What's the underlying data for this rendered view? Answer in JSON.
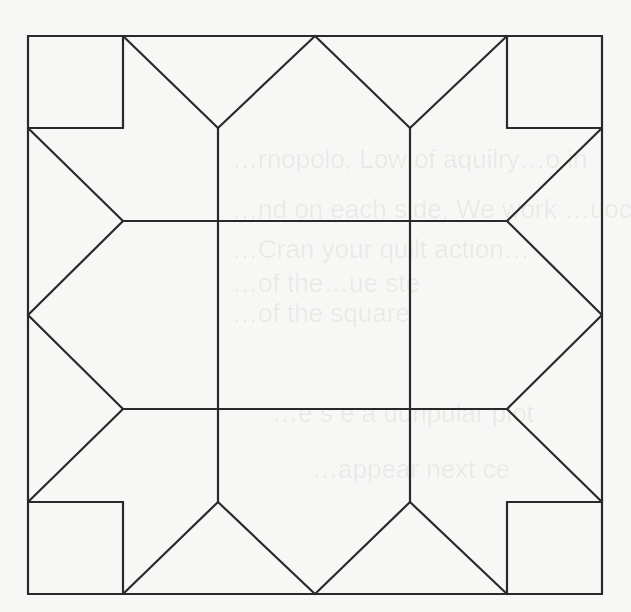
{
  "diagram": {
    "stroke_color": "#2a2a2a",
    "background_color": "#f7f7f5",
    "grid": {
      "xs": [
        28,
        123,
        218,
        315,
        410,
        507,
        602
      ],
      "ys": [
        36,
        128,
        221,
        315,
        409,
        502,
        594
      ]
    },
    "segments": [
      [
        28,
        36,
        602,
        36
      ],
      [
        602,
        36,
        602,
        594
      ],
      [
        602,
        594,
        28,
        594
      ],
      [
        28,
        594,
        28,
        36
      ],
      [
        123,
        36,
        123,
        128
      ],
      [
        28,
        128,
        123,
        128
      ],
      [
        507,
        36,
        507,
        128
      ],
      [
        507,
        128,
        602,
        128
      ],
      [
        28,
        502,
        123,
        502
      ],
      [
        123,
        502,
        123,
        594
      ],
      [
        507,
        502,
        602,
        502
      ],
      [
        507,
        502,
        507,
        594
      ],
      [
        123,
        36,
        218,
        128
      ],
      [
        218,
        128,
        315,
        36
      ],
      [
        315,
        36,
        410,
        128
      ],
      [
        410,
        128,
        507,
        36
      ],
      [
        123,
        594,
        218,
        502
      ],
      [
        218,
        502,
        315,
        594
      ],
      [
        315,
        594,
        410,
        502
      ],
      [
        410,
        502,
        507,
        594
      ],
      [
        28,
        128,
        123,
        221
      ],
      [
        123,
        221,
        28,
        315
      ],
      [
        28,
        315,
        123,
        409
      ],
      [
        123,
        409,
        28,
        502
      ],
      [
        602,
        128,
        507,
        221
      ],
      [
        507,
        221,
        602,
        315
      ],
      [
        602,
        315,
        507,
        409
      ],
      [
        507,
        409,
        602,
        502
      ],
      [
        218,
        128,
        218,
        502
      ],
      [
        410,
        128,
        410,
        502
      ],
      [
        123,
        221,
        507,
        221
      ],
      [
        123,
        409,
        507,
        409
      ]
    ]
  },
  "bleed_through_text": [
    {
      "text": "…rnopolo, Low of aquilry…o in",
      "x": 232,
      "y": 168
    },
    {
      "text": "…nd on each side. We work …uoc",
      "x": 232,
      "y": 218
    },
    {
      "text": "…Cran your quilt action…",
      "x": 232,
      "y": 258
    },
    {
      "text": "…of the…ue ste",
      "x": 232,
      "y": 292
    },
    {
      "text": "…of the square",
      "x": 232,
      "y": 322
    },
    {
      "text": "…e s e a uunpular plot",
      "x": 272,
      "y": 422
    },
    {
      "text": "…appear next ce",
      "x": 312,
      "y": 478
    }
  ]
}
